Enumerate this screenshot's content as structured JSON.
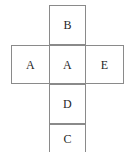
{
  "diagram": {
    "type": "cube-net",
    "shape": "cross",
    "background_color": "#ffffff",
    "line_color": "#8a8a8a",
    "label_color": "#1f1f1f",
    "cells": [
      {
        "id": "top",
        "label": "B",
        "row": 1,
        "column": 2
      },
      {
        "id": "left",
        "label": "A",
        "row": 2,
        "column": 1
      },
      {
        "id": "center",
        "label": "A",
        "row": 2,
        "column": 2
      },
      {
        "id": "right",
        "label": "E",
        "row": 2,
        "column": 3
      },
      {
        "id": "lower",
        "label": "D",
        "row": 3,
        "column": 2
      },
      {
        "id": "bottom",
        "label": "C",
        "row": 4,
        "column": 2
      }
    ]
  }
}
